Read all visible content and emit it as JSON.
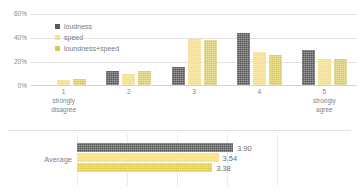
{
  "chart_data": [
    {
      "type": "bar",
      "title": "",
      "xlabel": "",
      "ylabel": "",
      "ylim": [
        0,
        60
      ],
      "grid": true,
      "legend_position": "top-left-inside",
      "ytick_labels": [
        "60%",
        "40%",
        "20%",
        "0%"
      ],
      "ytick_values": [
        60,
        40,
        20,
        0
      ],
      "categories": [
        "1",
        "2",
        "3",
        "4",
        "5"
      ],
      "category_sublabels": [
        "strongly disagree",
        "",
        "",
        "",
        "strongly agree"
      ],
      "series": [
        {
          "name": "loudness",
          "color": "#595959",
          "values": [
            0,
            12,
            15,
            44,
            30
          ]
        },
        {
          "name": "speed",
          "color": "#f7e08a",
          "values": [
            4,
            9,
            39,
            28,
            22
          ]
        },
        {
          "name": "loundness+speed",
          "color": "#dcc84e",
          "values": [
            5,
            12,
            38,
            25,
            22
          ]
        }
      ]
    },
    {
      "type": "bar",
      "orientation": "horizontal",
      "title": "",
      "xlabel": "",
      "ylabel": "",
      "xlim": [
        0,
        5
      ],
      "grid": true,
      "categories": [
        "Average"
      ],
      "series": [
        {
          "name": "loudness",
          "color": "#595959",
          "value": 3.9,
          "label": "3.90"
        },
        {
          "name": "speed",
          "color": "#f7e08a",
          "value": 3.54,
          "label": "3.54"
        },
        {
          "name": "loundness+speed",
          "color": "#dcc84e",
          "value": 3.38,
          "label": "3.38"
        }
      ]
    }
  ],
  "top_chart": {
    "yticks": [
      {
        "label": "60%"
      },
      {
        "label": "40%"
      },
      {
        "label": "20%"
      },
      {
        "label": "0%"
      }
    ],
    "legend": [
      {
        "label": "loudness"
      },
      {
        "label": "speed"
      },
      {
        "label": "loundness+speed"
      }
    ],
    "categories": [
      {
        "num": "1",
        "sub1": "strongly",
        "sub2": "disagree"
      },
      {
        "num": "2",
        "sub1": "",
        "sub2": ""
      },
      {
        "num": "3",
        "sub1": "",
        "sub2": ""
      },
      {
        "num": "4",
        "sub1": "",
        "sub2": ""
      },
      {
        "num": "5",
        "sub1": "strongly",
        "sub2": "agree"
      }
    ]
  },
  "avg_chart": {
    "row_label": "Average",
    "bars": [
      {
        "value_label": "3.90"
      },
      {
        "value_label": "3.54"
      },
      {
        "value_label": "3.38"
      }
    ]
  }
}
